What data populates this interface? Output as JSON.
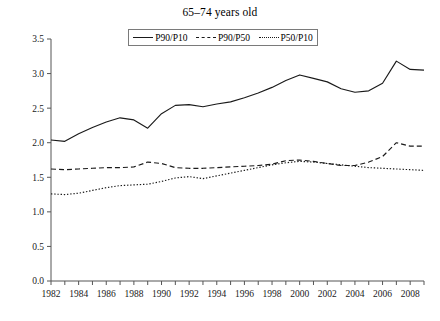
{
  "chart_data": {
    "type": "line",
    "title": "65–74 years old",
    "xlabel": "",
    "ylabel": "",
    "xlim": [
      1982,
      2009
    ],
    "ylim": [
      0.0,
      3.5
    ],
    "ytick_labels": [
      "0.0",
      "0.5",
      "1.0",
      "1.5",
      "2.0",
      "2.5",
      "3.0",
      "3.5"
    ],
    "ytick_values": [
      0.0,
      0.5,
      1.0,
      1.5,
      2.0,
      2.5,
      3.0,
      3.5
    ],
    "xtick_labels": [
      "1982",
      "1984",
      "1986",
      "1988",
      "1990",
      "1992",
      "1994",
      "1996",
      "1998",
      "2000",
      "2002",
      "2004",
      "2006",
      "2008"
    ],
    "xtick_values": [
      1982,
      1984,
      1986,
      1988,
      1990,
      1992,
      1994,
      1996,
      1998,
      2000,
      2002,
      2004,
      2006,
      2008
    ],
    "minor_xticks": [
      1982,
      1983,
      1984,
      1985,
      1986,
      1987,
      1988,
      1989,
      1990,
      1991,
      1992,
      1993,
      1994,
      1995,
      1996,
      1997,
      1998,
      1999,
      2000,
      2001,
      2002,
      2003,
      2004,
      2005,
      2006,
      2007,
      2008,
      2009
    ],
    "grid": false,
    "legend_position": "top-center",
    "x": [
      1982,
      1983,
      1984,
      1985,
      1986,
      1987,
      1988,
      1989,
      1990,
      1991,
      1992,
      1993,
      1994,
      1995,
      1996,
      1997,
      1998,
      1999,
      2000,
      2001,
      2002,
      2003,
      2004,
      2005,
      2006,
      2007,
      2008,
      2009
    ],
    "series": [
      {
        "name": "P90/P10",
        "style": "solid",
        "values": [
          2.04,
          2.02,
          2.13,
          2.22,
          2.3,
          2.36,
          2.33,
          2.21,
          2.42,
          2.54,
          2.55,
          2.52,
          2.56,
          2.59,
          2.65,
          2.72,
          2.8,
          2.9,
          2.98,
          2.93,
          2.88,
          2.78,
          2.73,
          2.75,
          2.86,
          3.18,
          3.06,
          3.05
        ]
      },
      {
        "name": "P90/P50",
        "style": "dashed",
        "values": [
          1.62,
          1.61,
          1.62,
          1.63,
          1.64,
          1.64,
          1.65,
          1.72,
          1.7,
          1.64,
          1.63,
          1.63,
          1.64,
          1.65,
          1.66,
          1.67,
          1.69,
          1.74,
          1.75,
          1.73,
          1.7,
          1.67,
          1.67,
          1.72,
          1.8,
          2.0,
          1.95,
          1.95
        ]
      },
      {
        "name": "P50/P10",
        "style": "dotted",
        "values": [
          1.26,
          1.25,
          1.27,
          1.31,
          1.35,
          1.38,
          1.39,
          1.4,
          1.44,
          1.49,
          1.51,
          1.48,
          1.52,
          1.56,
          1.6,
          1.64,
          1.68,
          1.71,
          1.73,
          1.72,
          1.7,
          1.68,
          1.66,
          1.64,
          1.63,
          1.62,
          1.61,
          1.6
        ]
      }
    ]
  },
  "legend": {
    "items": [
      {
        "label": "P90/P10",
        "style": "solid"
      },
      {
        "label": "P90/P50",
        "style": "dashed"
      },
      {
        "label": "P50/P10",
        "style": "dotted"
      }
    ]
  }
}
